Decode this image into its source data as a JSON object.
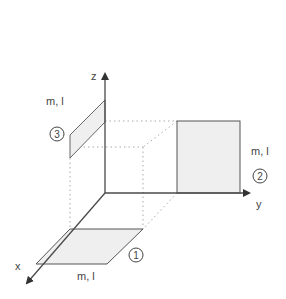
{
  "diagram": {
    "axes": {
      "x": {
        "label": "x"
      },
      "y": {
        "label": "y"
      },
      "z": {
        "label": "z"
      }
    },
    "plates": [
      {
        "id": 1,
        "number": "1",
        "label": "m, l",
        "plane": "xy"
      },
      {
        "id": 2,
        "number": "2",
        "label": "m, l",
        "plane": "yz"
      },
      {
        "id": 3,
        "number": "3",
        "label": "m, l",
        "plane": "xz"
      }
    ],
    "colors": {
      "line": "#555555",
      "axis": "#4a4a4a",
      "fill": "#efefef",
      "dotted": "#aaaaaa",
      "text": "#444444"
    }
  }
}
